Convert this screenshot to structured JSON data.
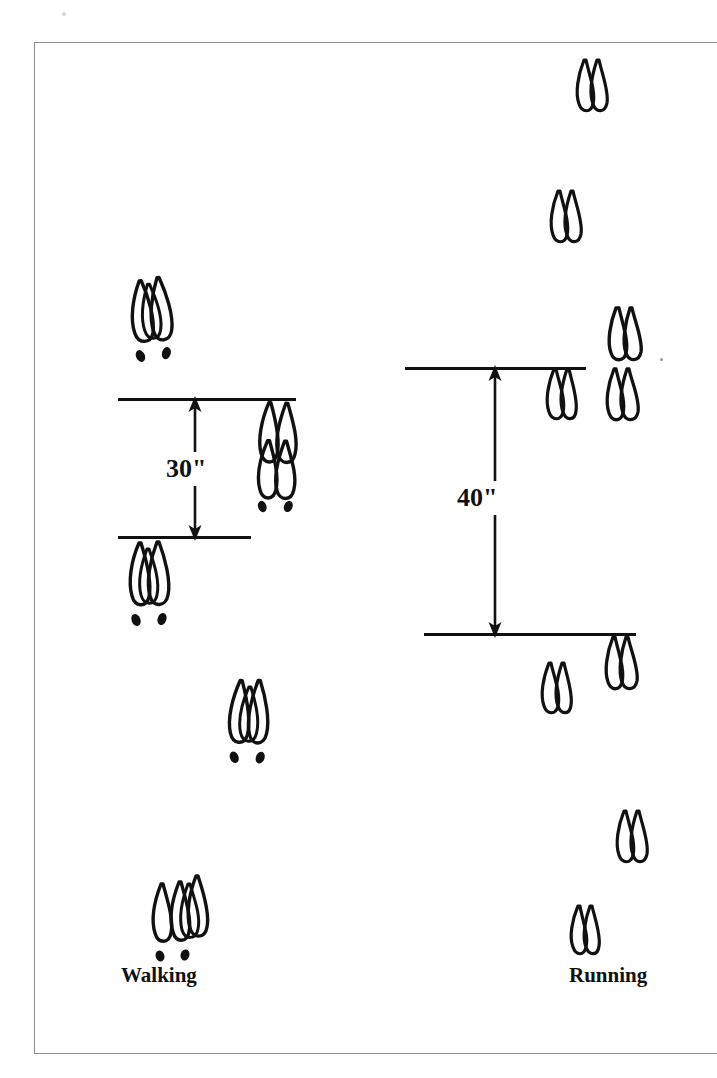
{
  "figure": {
    "type": "diagram",
    "background_color": "#ffffff",
    "ink_color": "#111111",
    "border_color": "#8d8d8d"
  },
  "labels": {
    "walking": "Walking",
    "running": "Running"
  },
  "measurements": [
    {
      "id": "walking-stride",
      "value": "30\"",
      "gait": "Walking",
      "arrow": "double-headed-vertical",
      "top_y": 399,
      "bottom_y": 537,
      "span_px": 138
    },
    {
      "id": "running-stride",
      "value": "40\"",
      "gait": "Running",
      "arrow": "double-headed-vertical",
      "top_y": 368,
      "bottom_y": 634,
      "span_px": 266
    }
  ],
  "baselines": [
    {
      "id": "walking-upper",
      "x": 118,
      "y": 399,
      "width": 178
    },
    {
      "id": "walking-lower",
      "x": 118,
      "y": 537,
      "width": 133
    },
    {
      "id": "running-upper",
      "x": 405,
      "y": 368,
      "width": 181
    },
    {
      "id": "running-lower",
      "x": 424,
      "y": 634,
      "width": 212
    }
  ],
  "tracks": {
    "walking": [
      {
        "id": "w1",
        "x": 122,
        "y": 274,
        "kind": "double-overlap",
        "dewclaws": true,
        "scale": 1.0,
        "rot": -4
      },
      {
        "id": "w2",
        "x": 248,
        "y": 401,
        "kind": "double-overlap",
        "dewclaws": true,
        "scale": 1.02,
        "rot": 2
      },
      {
        "id": "w3",
        "x": 120,
        "y": 540,
        "kind": "double-overlap",
        "dewclaws": true,
        "scale": 1.0,
        "rot": 0
      },
      {
        "id": "w4",
        "x": 219,
        "y": 677,
        "kind": "double-overlap",
        "dewclaws": true,
        "scale": 1.0,
        "rot": 3
      },
      {
        "id": "w5",
        "x": 146,
        "y": 872,
        "kind": "triple-overlap",
        "dewclaws": true,
        "scale": 1.06,
        "rot": 0
      }
    ],
    "running": [
      {
        "id": "r1",
        "x": 568,
        "y": 57,
        "kind": "single",
        "dewclaws": false,
        "scale": 0.95,
        "rot": 0
      },
      {
        "id": "r2",
        "x": 542,
        "y": 188,
        "kind": "single",
        "dewclaws": false,
        "scale": 0.95,
        "rot": 0
      },
      {
        "id": "r3",
        "x": 600,
        "y": 305,
        "kind": "single",
        "dewclaws": false,
        "scale": 1.0,
        "rot": 0
      },
      {
        "id": "r4",
        "x": 598,
        "y": 366,
        "kind": "single",
        "dewclaws": false,
        "scale": 0.98,
        "rot": 0
      },
      {
        "id": "r5",
        "x": 539,
        "y": 367,
        "kind": "single",
        "dewclaws": false,
        "scale": 0.92,
        "rot": 0
      },
      {
        "id": "r6",
        "x": 597,
        "y": 635,
        "kind": "single",
        "dewclaws": false,
        "scale": 0.98,
        "rot": 0
      },
      {
        "id": "r7",
        "x": 534,
        "y": 660,
        "kind": "single",
        "dewclaws": false,
        "scale": 0.92,
        "rot": 0
      },
      {
        "id": "r8",
        "x": 608,
        "y": 808,
        "kind": "single",
        "dewclaws": false,
        "scale": 0.95,
        "rot": 0
      },
      {
        "id": "r9",
        "x": 563,
        "y": 903,
        "kind": "single",
        "dewclaws": false,
        "scale": 0.9,
        "rot": 0
      }
    ]
  },
  "label_positions": {
    "walking": {
      "x": 121,
      "y": 963
    },
    "running": {
      "x": 569,
      "y": 963
    },
    "dim_30": {
      "x": 161,
      "y": 452
    },
    "dim_40": {
      "x": 452,
      "y": 481
    }
  }
}
